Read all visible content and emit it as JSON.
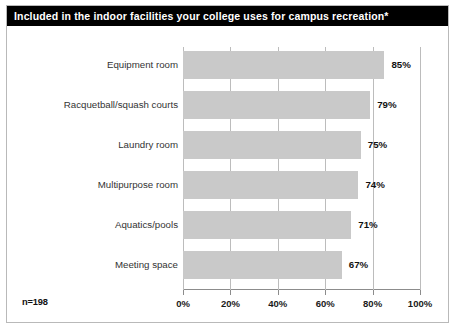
{
  "title": "Included in the indoor facilities your college uses for campus recreation*",
  "sample_note": "n=198",
  "chart_data": {
    "type": "bar",
    "orientation": "horizontal",
    "title": "Included in the indoor facilities your college uses for campus recreation*",
    "categories": [
      "Equipment room",
      "Racquetball/squash courts",
      "Laundry room",
      "Multipurpose room",
      "Aquatics/pools",
      "Meeting space"
    ],
    "values": [
      85,
      79,
      75,
      74,
      71,
      67
    ],
    "value_labels": [
      "85%",
      "79%",
      "75%",
      "74%",
      "71%",
      "67%"
    ],
    "xlabel": "",
    "ylabel": "",
    "xlim": [
      0,
      100
    ],
    "xticks": [
      0,
      20,
      40,
      60,
      80,
      100
    ],
    "xtick_labels": [
      "0%",
      "20%",
      "40%",
      "60%",
      "80%",
      "100%"
    ],
    "grid": true,
    "legend": false,
    "bar_color": "#c9c9c9",
    "title_background": "#000000",
    "title_color": "#ffffff",
    "annotation": "n=198"
  }
}
